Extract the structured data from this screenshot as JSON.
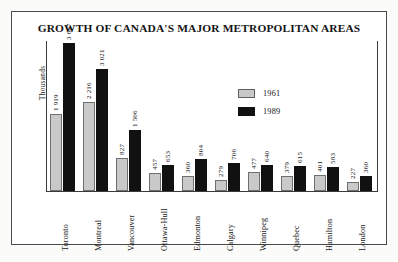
{
  "chart_data": {
    "type": "bar",
    "title": "GROWTH OF CANADA'S MAJOR METROPOLITAN AREAS",
    "xlabel": "",
    "ylabel": "Thousands",
    "grid": false,
    "legend_position": "inside-right",
    "ylim": [
      0,
      3667
    ],
    "categories": [
      "Toronto",
      "Montreal",
      "Vancouver",
      "Ottawa-Hull",
      "Edmonton",
      "Calgary",
      "Winnipeg",
      "Quebec",
      "Hamilton",
      "London"
    ],
    "series": [
      {
        "name": "1961",
        "color": "#c9c9c9",
        "values": [
          1919,
          2216,
          827,
          457,
          360,
          279,
          477,
          379,
          401,
          227
        ],
        "labels": [
          "1 919",
          "2 216",
          "827",
          "457",
          "360",
          "279",
          "477",
          "379",
          "401",
          "227"
        ]
      },
      {
        "name": "1989",
        "color": "#111111",
        "values": [
          3667,
          3021,
          1506,
          653,
          804,
          706,
          640,
          615,
          583,
          360
        ],
        "labels": [
          "3 667",
          "3 021",
          "1 506",
          "653",
          "804",
          "706",
          "640",
          "615",
          "583",
          "360"
        ]
      }
    ]
  },
  "legend": {
    "entries": [
      {
        "label": "1961",
        "key": "y1961"
      },
      {
        "label": "1989",
        "key": "y1989"
      }
    ]
  }
}
